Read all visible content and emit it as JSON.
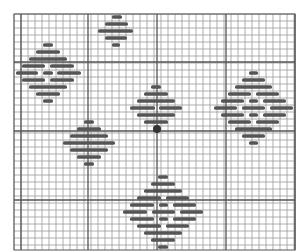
{
  "figure": {
    "grid": {
      "x0": 14,
      "y0": 14,
      "x1": 295,
      "y1": 250,
      "cell": 7.0,
      "heavy_x": [
        21,
        88,
        157,
        226,
        295
      ],
      "heavy_y": [
        62,
        131,
        200
      ],
      "line_color": "#9a9a9a",
      "heavy_color": "#555555"
    },
    "stitch_color": "#555555",
    "motifs": [
      {
        "name": "top-diamond",
        "bars": [
          [
            17,
            112,
            122
          ],
          [
            24,
            105,
            128
          ],
          [
            31,
            98,
            133
          ],
          [
            38,
            105,
            127
          ],
          [
            45,
            112,
            120
          ]
        ]
      },
      {
        "name": "left-diamond",
        "bars": [
          [
            45,
            43,
            53
          ],
          [
            52,
            36,
            60
          ],
          [
            59,
            29,
            67
          ],
          [
            66,
            22,
            45
          ],
          [
            66,
            50,
            74
          ],
          [
            73,
            16,
            38
          ],
          [
            73,
            43,
            53
          ],
          [
            73,
            57,
            81
          ],
          [
            80,
            22,
            45
          ],
          [
            80,
            50,
            74
          ],
          [
            87,
            29,
            67
          ],
          [
            94,
            36,
            60
          ],
          [
            101,
            43,
            53
          ]
        ]
      },
      {
        "name": "center-diamond",
        "bars": [
          [
            87,
            151,
            161
          ],
          [
            94,
            144,
            168
          ],
          [
            101,
            137,
            175
          ],
          [
            108,
            130,
            155
          ],
          [
            108,
            159,
            182
          ],
          [
            115,
            137,
            175
          ],
          [
            122,
            144,
            168
          ]
        ],
        "marker": {
          "x": 157,
          "y": 129,
          "r": 4
        }
      },
      {
        "name": "right-diamond",
        "bars": [
          [
            73,
            249,
            258
          ],
          [
            80,
            242,
            265
          ],
          [
            87,
            235,
            272
          ],
          [
            94,
            228,
            251
          ],
          [
            94,
            256,
            279
          ],
          [
            101,
            221,
            244
          ],
          [
            101,
            249,
            258
          ],
          [
            101,
            263,
            286
          ],
          [
            108,
            214,
            237
          ],
          [
            108,
            242,
            265
          ],
          [
            108,
            270,
            293
          ],
          [
            115,
            221,
            244
          ],
          [
            115,
            249,
            258
          ],
          [
            115,
            263,
            286
          ],
          [
            122,
            228,
            251
          ],
          [
            122,
            256,
            279
          ],
          [
            129,
            235,
            272
          ],
          [
            136,
            242,
            265
          ],
          [
            143,
            249,
            258
          ]
        ]
      },
      {
        "name": "lower-left-diamond",
        "bars": [
          [
            122,
            84,
            94
          ],
          [
            129,
            77,
            101
          ],
          [
            136,
            70,
            108
          ],
          [
            143,
            63,
            115
          ],
          [
            150,
            70,
            108
          ],
          [
            157,
            77,
            101
          ],
          [
            164,
            84,
            94
          ]
        ]
      },
      {
        "name": "bottom-diamond",
        "bars": [
          [
            177,
            158,
            168
          ],
          [
            184,
            151,
            175
          ],
          [
            191,
            144,
            182
          ],
          [
            198,
            137,
            161
          ],
          [
            198,
            166,
            189
          ],
          [
            205,
            130,
            154
          ],
          [
            205,
            159,
            168
          ],
          [
            205,
            173,
            196
          ],
          [
            212,
            123,
            147
          ],
          [
            212,
            152,
            175
          ],
          [
            212,
            180,
            203
          ],
          [
            219,
            130,
            154
          ],
          [
            219,
            159,
            168
          ],
          [
            219,
            173,
            196
          ],
          [
            226,
            137,
            161
          ],
          [
            226,
            166,
            189
          ],
          [
            233,
            144,
            182
          ],
          [
            240,
            151,
            175
          ],
          [
            247,
            158,
            168
          ]
        ]
      }
    ]
  }
}
